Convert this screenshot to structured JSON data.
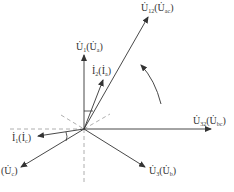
{
  "diagram": {
    "type": "phasor",
    "origin": [
      84,
      129
    ],
    "colors": {
      "line": "#333333",
      "dashed": "#999999"
    },
    "phasors": [
      {
        "id": "U12",
        "label_main": "U",
        "label_sub": "12",
        "label_alt": "U",
        "label_alt_sub": "ac",
        "tip": [
          148,
          17
        ]
      },
      {
        "id": "U1",
        "label_main": "U",
        "label_sub": "1",
        "label_alt": "U",
        "label_alt_sub": "a",
        "tip": [
          84,
          55
        ]
      },
      {
        "id": "I2",
        "label_main": "I",
        "label_sub": "2",
        "label_alt": "I",
        "label_alt_sub": "a",
        "tip": [
          103,
          80
        ]
      },
      {
        "id": "U32",
        "label_main": "U",
        "label_sub": "32",
        "label_alt": "U",
        "label_alt_sub": "bc",
        "tip": [
          211,
          129
        ]
      },
      {
        "id": "I1",
        "label_main": "I",
        "label_sub": "1",
        "label_alt": "I",
        "label_alt_sub": "c",
        "tip": [
          38,
          136
        ]
      },
      {
        "id": "Uc",
        "label_main": "",
        "label_sub": "",
        "label_alt": "U",
        "label_alt_sub": "c",
        "tip": [
          21,
          167
        ]
      },
      {
        "id": "U3",
        "label_main": "U",
        "label_sub": "3",
        "label_alt": "U",
        "label_alt_sub": "b",
        "tip": [
          145,
          167
        ]
      }
    ]
  },
  "labels": {
    "u12": {
      "main": "U",
      "sub": "12",
      "paren_main": "U",
      "paren_sub": "ac"
    },
    "u1": {
      "main": "U",
      "sub": "1",
      "paren_main": "U",
      "paren_sub": "a"
    },
    "i2": {
      "main": "I",
      "sub": "2",
      "paren_main": "I",
      "paren_sub": "a"
    },
    "u32": {
      "main": "U",
      "sub": "32",
      "paren_main": "U",
      "paren_sub": "bc"
    },
    "i1": {
      "main": "I",
      "sub": "1",
      "paren_main": "I",
      "paren_sub": "c"
    },
    "uc": {
      "paren_main": "U",
      "paren_sub": "c"
    },
    "u3": {
      "main": "U",
      "sub": "3",
      "paren_main": "U",
      "paren_sub": "b"
    }
  }
}
